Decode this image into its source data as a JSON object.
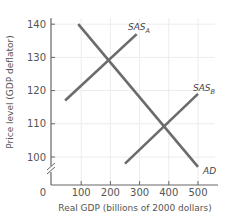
{
  "chart_data": {
    "type": "line",
    "title": "",
    "xlabel": "Real GDP (billions of 2000 dollars)",
    "ylabel": "Price level (GDP deflator)",
    "xlim": [
      0,
      580
    ],
    "ylim": [
      95,
      142
    ],
    "x_ticks": [
      "0",
      "100",
      "200",
      "300",
      "400",
      "500"
    ],
    "y_ticks": [
      "100",
      "110",
      "120",
      "130",
      "140"
    ],
    "y_axis_break": true,
    "grid": true,
    "series": [
      {
        "name": "AD",
        "label_main": "AD",
        "label_sub": "",
        "points": [
          [
            90,
            140
          ],
          [
            200,
            130
          ],
          [
            400,
            110
          ],
          [
            500,
            97
          ]
        ]
      },
      {
        "name": "SAS_A",
        "label_main": "SAS",
        "label_sub": "A",
        "points": [
          [
            45,
            117
          ],
          [
            200,
            130
          ],
          [
            290,
            137
          ]
        ]
      },
      {
        "name": "SAS_B",
        "label_main": "SAS",
        "label_sub": "B",
        "points": [
          [
            250,
            98
          ],
          [
            400,
            110
          ],
          [
            500,
            119
          ]
        ]
      }
    ],
    "equilibria": [
      {
        "x": 200,
        "y": 130,
        "curves": [
          "AD",
          "SAS_A"
        ]
      },
      {
        "x": 400,
        "y": 110,
        "curves": [
          "AD",
          "SAS_B"
        ]
      }
    ]
  },
  "labels": {
    "zero": "0"
  },
  "colors": {
    "line": "#6b6b6b",
    "axis": "#666666",
    "grid": "#ececec",
    "text": "#555555"
  }
}
